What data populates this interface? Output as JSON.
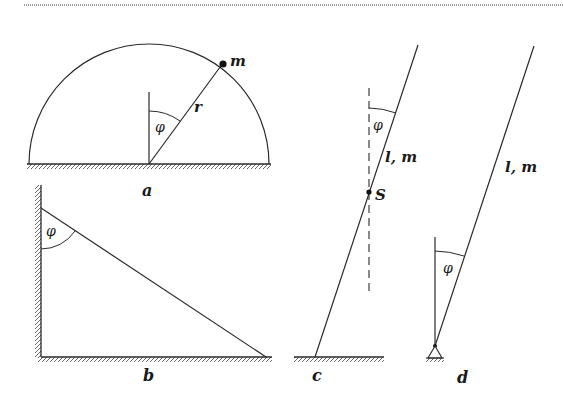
{
  "figure": {
    "panels": [
      {
        "id": "a",
        "caption": "a",
        "description": "Point mass m on a semicircle of radius r, angle phi from vertical",
        "labels": {
          "mass": "m",
          "radius": "r",
          "angle": "φ"
        }
      },
      {
        "id": "b",
        "caption": "b",
        "description": "Rod leaning between a vertical wall and a horizontal floor, angle phi at wall",
        "labels": {
          "angle": "φ"
        }
      },
      {
        "id": "c",
        "caption": "c",
        "description": "Rod of length l and mass m on a floor with center of mass S, dashed vertical reference, angle phi",
        "labels": {
          "angle": "φ",
          "rod": "l, m",
          "center": "S"
        }
      },
      {
        "id": "d",
        "caption": "d",
        "description": "Rod of length l and mass m pinned at a hinge support, angle phi from vertical",
        "labels": {
          "angle": "φ",
          "rod": "l, m"
        }
      }
    ],
    "colors": {
      "stroke": "#2a2a2a",
      "background": "#ffffff",
      "rule": "#9a9a9a"
    }
  }
}
